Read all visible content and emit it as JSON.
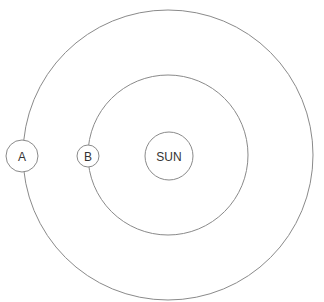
{
  "diagram": {
    "title": "",
    "orbits": [
      {
        "name": "outer-orbit",
        "cx": 168,
        "cy": 155,
        "r": 145
      },
      {
        "name": "inner-orbit",
        "cx": 168,
        "cy": 155,
        "r": 80
      }
    ],
    "bodies": [
      {
        "id": "sun",
        "label": "SUN",
        "cx": 169,
        "cy": 156,
        "r": 24
      },
      {
        "id": "a",
        "label": "A",
        "cx": 22,
        "cy": 156,
        "r": 16
      },
      {
        "id": "b",
        "label": "B",
        "cx": 88,
        "cy": 156,
        "r": 11
      }
    ],
    "stroke_color": "#8a8a8a"
  }
}
